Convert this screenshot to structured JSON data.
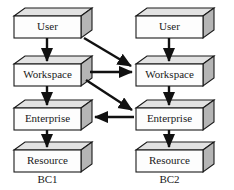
{
  "diagram": {
    "colors": {
      "box_face": "#fdfdfd",
      "box_side": "#b5b5b5",
      "box_top": "#e2e2e2",
      "stroke": "#1a1a1a",
      "arrow": "#111111",
      "background": "#ffffff"
    },
    "columns": [
      {
        "id": "bc1",
        "label": "BC1",
        "nodes": [
          {
            "id": "bc1-user",
            "label": "User"
          },
          {
            "id": "bc1-workspace",
            "label": "Workspace"
          },
          {
            "id": "bc1-enterprise",
            "label": "Enterprise"
          },
          {
            "id": "bc1-resource",
            "label": "Resource"
          }
        ]
      },
      {
        "id": "bc2",
        "label": "BC2",
        "nodes": [
          {
            "id": "bc2-user",
            "label": "User"
          },
          {
            "id": "bc2-workspace",
            "label": "Workspace"
          },
          {
            "id": "bc2-enterprise",
            "label": "Enterprise"
          },
          {
            "id": "bc2-resource",
            "label": "Resource"
          }
        ]
      }
    ],
    "connections": [
      {
        "id": "c1",
        "from": "bc1-user",
        "to": "bc1-workspace",
        "kind": "vertical-down"
      },
      {
        "id": "c2",
        "from": "bc1-workspace",
        "to": "bc1-enterprise",
        "kind": "vertical-down"
      },
      {
        "id": "c3",
        "from": "bc1-enterprise",
        "to": "bc1-resource",
        "kind": "vertical-down"
      },
      {
        "id": "c4",
        "from": "bc2-user",
        "to": "bc2-workspace",
        "kind": "vertical-down"
      },
      {
        "id": "c5",
        "from": "bc2-workspace",
        "to": "bc2-enterprise",
        "kind": "vertical-down"
      },
      {
        "id": "c6",
        "from": "bc2-enterprise",
        "to": "bc2-resource",
        "kind": "vertical-down"
      },
      {
        "id": "c7",
        "from": "bc1-user",
        "to": "bc2-workspace",
        "kind": "diagonal-down-right"
      },
      {
        "id": "c8",
        "from": "bc1-workspace",
        "to": "bc2-workspace",
        "kind": "horizontal-right"
      },
      {
        "id": "c9",
        "from": "bc1-workspace",
        "to": "bc2-enterprise",
        "kind": "diagonal-down-right"
      },
      {
        "id": "c10",
        "from": "bc2-enterprise",
        "to": "bc1-enterprise",
        "kind": "horizontal-left"
      }
    ]
  }
}
